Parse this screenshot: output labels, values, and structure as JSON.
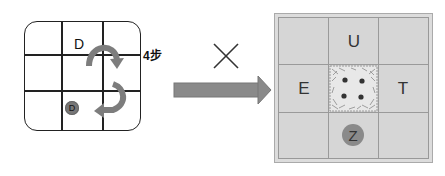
{
  "left_diagram": {
    "grid_rows": 3,
    "grid_cols": 3,
    "start_face_label": "D",
    "end_face_label": "D",
    "steps_label": "4步",
    "arrows": [
      "roll-right-arc",
      "roll-down-left-arc"
    ]
  },
  "operator": {
    "symbol": "×"
  },
  "transition_arrow": {
    "direction": "right",
    "color": "#888888"
  },
  "right_diagram": {
    "grid_rows": 3,
    "grid_cols": 3,
    "faces": {
      "top": "U",
      "left": "E",
      "right": "T",
      "bottom": "Z",
      "center": "dotted-four-pattern"
    },
    "background_color": "#d6d6d6"
  }
}
